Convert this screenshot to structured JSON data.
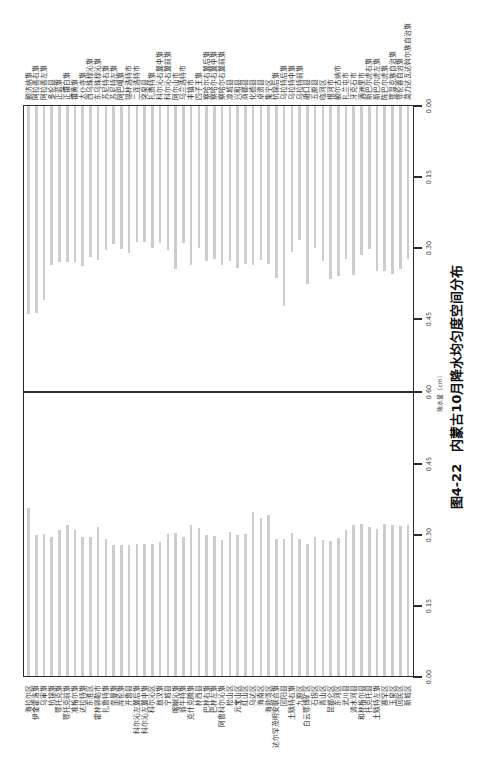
{
  "chart_data": {
    "type": "bar",
    "orientation": "horizontal",
    "layout": "two back-to-back bar panels meeting at a center line (0.60); whole figure printed rotated 90 degrees counter-clockwise",
    "figure_label": "图4-22",
    "title": "内蒙古10月降水均匀度空间分布",
    "xlabel": "降水量（cm）",
    "ylabel": "",
    "xlim": [
      0,
      0.6
    ],
    "xtick_labels": [
      "0.00",
      "0.15",
      "0.30",
      "0.45",
      "0.60",
      "0.45",
      "0.30",
      "0.15",
      "0.00"
    ],
    "grid": false,
    "legend": null,
    "bar_color": "#cdcdcd",
    "axis_color": "#2b2b2b",
    "series": [
      {
        "panel": "left",
        "categories": [
          "海拉尔区",
          "伊金霍洛旗",
          "乌审旗",
          "杭锦旗",
          "鄂托克旗",
          "鄂托克前旗",
          "准格尔旗",
          "达拉特旗",
          "东胜区",
          "霍林郭勒市",
          "扎鲁特旗",
          "奈曼旗",
          "库伦旗",
          "开鲁县",
          "科尔沁左翼后旗",
          "科尔沁左翼中旗",
          "科尔沁区",
          "敖汉旗",
          "宁城县",
          "喀喇沁旗",
          "翁牛特旗",
          "克什克腾旗",
          "林西县",
          "巴林右旗",
          "巴林左旗",
          "阿鲁科尔沁旗",
          "松山区",
          "元宝山区",
          "红山区",
          "乌达区",
          "海南区",
          "海勃湾区",
          "达尔罕茂明安联合旗",
          "固阳县",
          "土默特右旗",
          "九原区",
          "白云鄂博矿区",
          "石拐区",
          "青山区",
          "昆都仑区",
          "东河区",
          "武川县",
          "清水河县",
          "和林格尔县",
          "托克托县",
          "土默特左旗",
          "赛罕区",
          "玉泉区",
          "回民区",
          "新城区"
        ],
        "values": [
          0.355,
          0.297,
          0.3,
          0.294,
          0.307,
          0.318,
          0.309,
          0.293,
          0.294,
          0.314,
          0.288,
          0.277,
          0.277,
          0.277,
          0.279,
          0.279,
          0.279,
          0.283,
          0.3,
          0.302,
          0.294,
          0.319,
          0.312,
          0.298,
          0.296,
          0.286,
          0.304,
          0.297,
          0.3,
          0.346,
          0.334,
          0.339,
          0.29,
          0.289,
          0.302,
          0.288,
          0.279,
          0.294,
          0.286,
          0.284,
          0.291,
          0.309,
          0.319,
          0.321,
          0.314,
          0.311,
          0.32,
          0.318,
          0.316,
          0.319
        ]
      },
      {
        "panel": "right",
        "categories": [
          "额济纳旗",
          "阿拉善右旗",
          "阿拉善左旗",
          "多伦县",
          "正蓝旗",
          "正镶白旗",
          "镶黄旗",
          "太仆寺旗",
          "西乌珠穆沁旗",
          "东乌珠穆沁旗",
          "苏尼特右旗",
          "苏尼特左旗",
          "阿巴嘎旗",
          "锡林浩特市",
          "二连浩特市",
          "突泉县",
          "扎赉特旗",
          "科尔沁右翼中旗",
          "科尔沁右翼前旗",
          "阿尔山市",
          "乌兰浩特市",
          "丰镇市",
          "四子王旗",
          "察哈尔右翼后旗",
          "察哈尔右翼中旗",
          "察哈尔右翼前旗",
          "凉城县",
          "兴和县",
          "商都县",
          "化德县",
          "卓资县",
          "集宁区",
          "杭锦后旗",
          "乌拉特后旗",
          "乌拉特中旗",
          "乌拉特前旗",
          "磴口县",
          "五原县",
          "临河区",
          "根河市",
          "额尔古纳市",
          "扎兰屯市",
          "牙克石市",
          "满洲里市",
          "新巴尔虎右旗",
          "新巴尔虎左旗",
          "陈巴尔虎旗",
          "鄂温克族自治旗",
          "鄂伦春自治旗",
          "莫力达瓦达斡尔族自治旗"
        ],
        "values": [
          0.44,
          0.438,
          0.41,
          0.336,
          0.33,
          0.33,
          0.33,
          0.338,
          0.319,
          0.326,
          0.304,
          0.292,
          0.301,
          0.311,
          0.287,
          0.287,
          0.299,
          0.29,
          0.304,
          0.345,
          0.29,
          0.336,
          0.299,
          0.327,
          0.322,
          0.335,
          0.328,
          0.341,
          0.334,
          0.336,
          0.326,
          0.333,
          0.362,
          0.423,
          0.308,
          0.283,
          0.375,
          0.3,
          0.328,
          0.366,
          0.359,
          0.322,
          0.356,
          0.314,
          0.302,
          0.348,
          0.349,
          0.355,
          0.343,
          0.322
        ]
      }
    ]
  }
}
